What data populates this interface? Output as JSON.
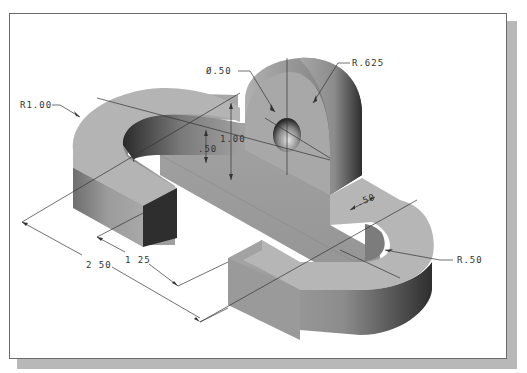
{
  "figure": {
    "type": "isometric technical drawing"
  },
  "dimensions": {
    "hole_diameter": "Ø.50",
    "boss_radius": "R.625",
    "outer_radius_left": "R1.00",
    "boss_height": "1.00",
    "base_thickness": ".50",
    "arm_width": ".50",
    "inner_radius_right": "R.50",
    "inner_length": "1 25",
    "overall_length": "2 50"
  },
  "colors": {
    "frame_border": "#6a6a6a",
    "shadow": "#b8b8b8",
    "surface_light": "#b4b4b4",
    "surface_mid": "#9a9a9a",
    "surface_dark": "#3a3a3a",
    "dimension_line": "#333333"
  }
}
